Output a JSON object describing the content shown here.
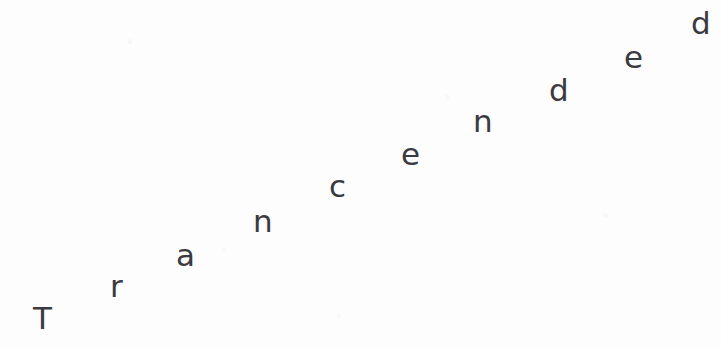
{
  "canvas": {
    "width": 721,
    "height": 347,
    "background_color": "#fdfdfd"
  },
  "artwork": {
    "name": "diagonal-letter-arrangement",
    "full_text": "Transcended",
    "reading_order": "bottom-left to top-right, ascending diagonal",
    "text_color": "#3a3a40",
    "font_size_px": 31,
    "letters": [
      {
        "char": "T",
        "x": 33,
        "baseline_y": 334,
        "size": 31
      },
      {
        "char": "r",
        "x": 110,
        "baseline_y": 302,
        "size": 31
      },
      {
        "char": "a",
        "x": 176,
        "baseline_y": 271,
        "size": 31
      },
      {
        "char": "n",
        "x": 253,
        "baseline_y": 237,
        "size": 31
      },
      {
        "char": "c",
        "x": 329,
        "baseline_y": 202,
        "size": 31
      },
      {
        "char": "e",
        "x": 401,
        "baseline_y": 170,
        "size": 31
      },
      {
        "char": "n",
        "x": 473,
        "baseline_y": 137,
        "size": 31
      },
      {
        "char": "d",
        "x": 549,
        "baseline_y": 106,
        "size": 31
      },
      {
        "char": "e",
        "x": 624,
        "baseline_y": 73,
        "size": 31
      },
      {
        "char": "d",
        "x": 691,
        "baseline_y": 39,
        "size": 31
      }
    ]
  }
}
